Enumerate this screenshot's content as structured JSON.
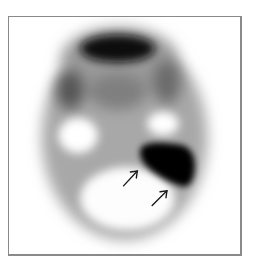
{
  "figure": {
    "type": "nuclear-medicine-scintigraphy",
    "colors": {
      "background": "#ffffff",
      "frame": "#8a8a8a",
      "high_uptake": "#0a0a0a",
      "mid_uptake": "#8c8c8c",
      "low_uptake": "#f4f4f4",
      "arrow": "#1a1a1a"
    },
    "annotations": [
      {
        "kind": "arrow",
        "name": "arrow-1",
        "from": [
          124,
          187
        ],
        "to": [
          138,
          172
        ]
      },
      {
        "kind": "arrow",
        "name": "arrow-2",
        "from": [
          153,
          207
        ],
        "to": [
          168,
          192
        ]
      }
    ]
  }
}
